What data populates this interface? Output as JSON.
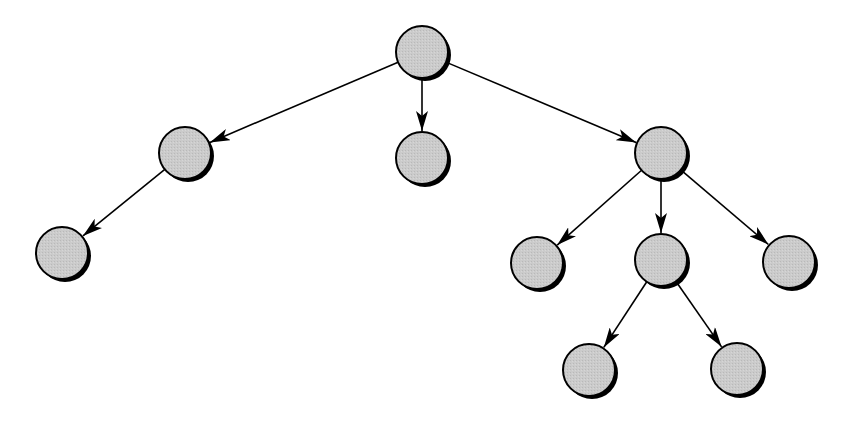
{
  "diagram": {
    "type": "tree",
    "background": "#ffffff",
    "node_fill": "#c8c8c8",
    "node_stroke": "#000000",
    "shadow_color": "#000000",
    "edge_color": "#000000",
    "node_radius": 26,
    "nodes": [
      {
        "id": "root",
        "x": 422,
        "y": 52
      },
      {
        "id": "a",
        "x": 185,
        "y": 153
      },
      {
        "id": "b",
        "x": 422,
        "y": 158
      },
      {
        "id": "c",
        "x": 661,
        "y": 153
      },
      {
        "id": "a1",
        "x": 62,
        "y": 253
      },
      {
        "id": "c1",
        "x": 537,
        "y": 263
      },
      {
        "id": "c2",
        "x": 661,
        "y": 260
      },
      {
        "id": "c3",
        "x": 789,
        "y": 262
      },
      {
        "id": "c2a",
        "x": 589,
        "y": 370
      },
      {
        "id": "c2b",
        "x": 737,
        "y": 369
      }
    ],
    "edges": [
      {
        "from": "root",
        "to": "a"
      },
      {
        "from": "root",
        "to": "b"
      },
      {
        "from": "root",
        "to": "c"
      },
      {
        "from": "a",
        "to": "a1"
      },
      {
        "from": "c",
        "to": "c1"
      },
      {
        "from": "c",
        "to": "c2"
      },
      {
        "from": "c",
        "to": "c3"
      },
      {
        "from": "c2",
        "to": "c2a"
      },
      {
        "from": "c2",
        "to": "c2b"
      }
    ]
  }
}
